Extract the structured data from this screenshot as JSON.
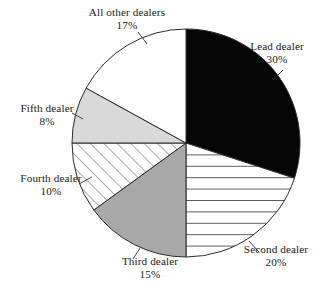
{
  "chart_data": {
    "type": "pie",
    "title": "",
    "categories": [
      "Lead dealer",
      "Second dealer",
      "Third dealer",
      "Fourth dealer",
      "Fifth dealer",
      "All other dealers"
    ],
    "values": [
      30,
      20,
      15,
      10,
      8,
      17
    ],
    "value_labels": [
      "30%",
      "20%",
      "15%",
      "10%",
      "8%",
      "17%"
    ],
    "unit": "%",
    "legend": "none",
    "labels_position": "outside-with-leader-lines",
    "start_angle_deg": 0,
    "direction": "clockwise",
    "slices": [
      {
        "name": "Lead dealer",
        "value": 30,
        "value_label": "30%",
        "fill_style": "solid-black",
        "color": "#050505",
        "start_deg": 0,
        "end_deg": 108
      },
      {
        "name": "Second dealer",
        "value": 20,
        "value_label": "20%",
        "fill_style": "horizontal-hatch",
        "color": "#ffffff",
        "start_deg": 108,
        "end_deg": 180
      },
      {
        "name": "Third dealer",
        "value": 15,
        "value_label": "15%",
        "fill_style": "solid-gray",
        "color": "#a8a8a8",
        "start_deg": 180,
        "end_deg": 234
      },
      {
        "name": "Fourth dealer",
        "value": 10,
        "value_label": "10%",
        "fill_style": "diagonal-hatch",
        "color": "#ffffff",
        "start_deg": 234,
        "end_deg": 270
      },
      {
        "name": "Fifth dealer",
        "value": 8,
        "value_label": "8%",
        "fill_style": "solid-light-gray",
        "color": "#d9d9d9",
        "start_deg": 270,
        "end_deg": 298.8
      },
      {
        "name": "All other dealers",
        "value": 17,
        "value_label": "17%",
        "fill_style": "solid-white",
        "color": "#ffffff",
        "start_deg": 298.8,
        "end_deg": 360
      }
    ]
  },
  "labels": {
    "all_other": {
      "name": "All other dealers",
      "pct": "17%"
    },
    "lead": {
      "name": "Lead dealer",
      "pct": "30%"
    },
    "second": {
      "name": "Second dealer",
      "pct": "20%"
    },
    "third": {
      "name": "Third dealer",
      "pct": "15%"
    },
    "fourth": {
      "name": "Fourth dealer",
      "pct": "10%"
    },
    "fifth": {
      "name": "Fifth dealer",
      "pct": "8%"
    }
  },
  "colors": {
    "outline": "#2b2b2b",
    "lead_fill": "#050505",
    "third_fill": "#a8a8a8",
    "fifth_fill": "#d9d9d9",
    "background": "#ffffff",
    "text": "#1a1a1a"
  }
}
